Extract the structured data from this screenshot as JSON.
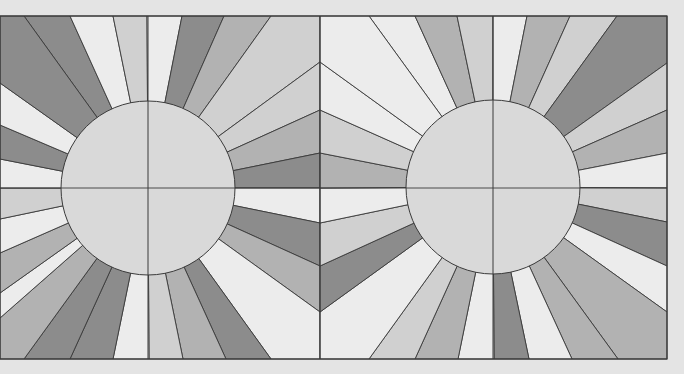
{
  "canvas": {
    "width": 684,
    "height": 374,
    "background": "#e4e4e4"
  },
  "palette": {
    "dark": "#8c8c8c",
    "medium": "#b2b2b2",
    "light": "#d0d0d0",
    "pale": "#ececec",
    "sun": "#d9d9d9",
    "line": "#3a3a3a"
  },
  "frame": {
    "x": 0,
    "y": 16,
    "width": 667,
    "height": 343,
    "divider_x": 320
  },
  "panels": [
    {
      "name": "left-sunburst-panel",
      "sun": {
        "cx": 148,
        "cy": 188,
        "r": 87
      },
      "perimeter": [
        [
          24,
          16
        ],
        [
          70,
          16
        ],
        [
          113,
          16
        ],
        [
          147,
          16
        ],
        [
          182,
          16
        ],
        [
          224,
          16
        ],
        [
          271,
          16
        ],
        [
          320,
          62
        ],
        [
          320,
          110
        ],
        [
          320,
          153
        ],
        [
          320,
          188
        ],
        [
          320,
          223
        ],
        [
          320,
          266
        ],
        [
          320,
          312
        ],
        [
          271,
          359
        ],
        [
          226,
          359
        ],
        [
          183,
          359
        ],
        [
          149,
          359
        ],
        [
          113,
          359
        ],
        [
          70,
          359
        ],
        [
          24,
          359
        ],
        [
          0,
          318
        ],
        [
          0,
          293
        ],
        [
          0,
          253
        ],
        [
          0,
          219
        ],
        [
          0,
          188
        ],
        [
          0,
          159
        ],
        [
          0,
          125
        ],
        [
          0,
          83
        ]
      ],
      "corners": [
        [
          0,
          16
        ],
        [
          320,
          16
        ],
        [
          320,
          359
        ],
        [
          0,
          359
        ]
      ],
      "ray_tones": [
        "dark",
        "pale",
        "light",
        "pale",
        "dark",
        "medium",
        "light",
        "light",
        "medium",
        "dark",
        "pale",
        "dark",
        "medium",
        "pale",
        "dark",
        "medium",
        "light",
        "pale",
        "dark",
        "dark",
        "medium",
        "pale",
        "medium",
        "pale",
        "light",
        "pale",
        "dark",
        "pale",
        "dark"
      ],
      "corner_tones": [
        "light",
        "light",
        "dark",
        "medium"
      ]
    },
    {
      "name": "right-sunburst-panel",
      "sun": {
        "cx": 493,
        "cy": 187,
        "r": 87
      },
      "perimeter": [
        [
          369,
          16
        ],
        [
          415,
          16
        ],
        [
          457,
          16
        ],
        [
          493,
          16
        ],
        [
          527,
          16
        ],
        [
          570,
          16
        ],
        [
          617,
          16
        ],
        [
          667,
          63
        ],
        [
          667,
          110
        ],
        [
          667,
          153
        ],
        [
          667,
          188
        ],
        [
          667,
          222
        ],
        [
          667,
          266
        ],
        [
          667,
          312
        ],
        [
          618,
          359
        ],
        [
          572,
          359
        ],
        [
          529,
          359
        ],
        [
          494,
          359
        ],
        [
          458,
          359
        ],
        [
          415,
          359
        ],
        [
          369,
          359
        ],
        [
          320,
          312
        ],
        [
          320,
          266
        ],
        [
          320,
          223
        ],
        [
          320,
          188
        ],
        [
          320,
          153
        ],
        [
          320,
          110
        ],
        [
          320,
          62
        ]
      ],
      "corners": [
        [
          320,
          16
        ],
        [
          667,
          16
        ],
        [
          667,
          359
        ],
        [
          320,
          359
        ]
      ],
      "ray_tones": [
        "pale",
        "medium",
        "light",
        "pale",
        "medium",
        "light",
        "dark",
        "light",
        "medium",
        "pale",
        "light",
        "dark",
        "pale",
        "medium",
        "medium",
        "pale",
        "dark",
        "pale",
        "medium",
        "light",
        "pale",
        "dark",
        "light",
        "pale",
        "medium",
        "light",
        "pale",
        "pale"
      ],
      "corner_tones": [
        "light",
        "dark",
        "medium",
        "dark"
      ]
    }
  ]
}
